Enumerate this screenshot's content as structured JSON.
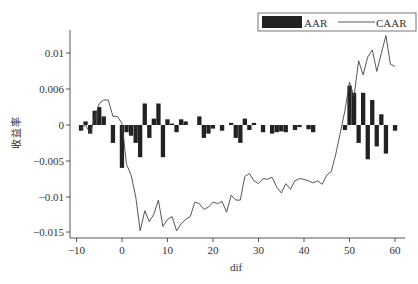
{
  "chart_data": {
    "type": "bar",
    "title": "",
    "xlabel": "dif",
    "ylabel": "收益率",
    "xlim": [
      -11,
      62
    ],
    "ylim": [
      -0.0155,
      0.0135
    ],
    "x_ticks": [
      -10,
      0,
      10,
      20,
      30,
      40,
      50,
      60
    ],
    "x_tick_labels": [
      "-10",
      "0",
      "10",
      "20",
      "30",
      "40",
      "50",
      "60"
    ],
    "y_ticks": [
      0.01,
      0.005,
      0,
      -0.005,
      -0.01,
      -0.015
    ],
    "y_tick_labels": [
      "0.01",
      "0.006",
      "0",
      "-0.005",
      "-0.01",
      "-0.015"
    ],
    "grid": false,
    "legend_position": "top-right",
    "legend": [
      "AAR",
      "CAAR"
    ],
    "x": [
      -9,
      -8,
      -7,
      -6,
      -5,
      -4,
      -3,
      -2,
      -1,
      0,
      1,
      2,
      3,
      4,
      5,
      6,
      7,
      8,
      9,
      10,
      11,
      12,
      13,
      14,
      15,
      16,
      17,
      18,
      19,
      20,
      21,
      22,
      23,
      24,
      25,
      26,
      27,
      28,
      29,
      30,
      31,
      32,
      33,
      34,
      35,
      36,
      37,
      38,
      39,
      40,
      41,
      42,
      43,
      44,
      45,
      46,
      47,
      48,
      49,
      50,
      51,
      52,
      53,
      54,
      55,
      56,
      57,
      58,
      59,
      60
    ],
    "series": [
      {
        "name": "AAR",
        "type": "bar",
        "color": "#222222",
        "values": [
          -0.0008,
          0.0005,
          -0.0012,
          0.002,
          0.0025,
          0.0012,
          0.0,
          -0.0025,
          0.0,
          -0.006,
          -0.001,
          -0.0015,
          -0.0025,
          -0.0045,
          0.003,
          -0.0018,
          0.0009,
          0.003,
          -0.0045,
          0.0008,
          0.0002,
          -0.001,
          0.0008,
          0.0005,
          0.0,
          0.0,
          0.0012,
          -0.0018,
          -0.0012,
          -0.0005,
          0.0,
          -0.0008,
          0.0,
          0.0003,
          -0.0018,
          -0.0025,
          0.0009,
          -0.0007,
          0.0003,
          0.0,
          -0.001,
          0.0,
          -0.0012,
          -0.001,
          -0.0009,
          -0.001,
          0.0,
          -0.0007,
          -0.0003,
          0.0,
          -0.0006,
          -0.001,
          0.0,
          0.0,
          0.0,
          0.0,
          0.0,
          0.0,
          -0.0007,
          0.0055,
          0.0045,
          -0.0025,
          0.0045,
          -0.0048,
          0.0035,
          -0.003,
          0.0015,
          -0.004,
          0.0,
          -0.0008
        ]
      },
      {
        "name": "CAAR",
        "type": "line",
        "color": "#444444",
        "values": [
          -0.0005,
          0.0,
          -0.0012,
          0.001,
          0.003,
          0.0035,
          0.0035,
          0.0012,
          0.0012,
          0.0002,
          -0.0055,
          -0.007,
          -0.01,
          -0.0148,
          -0.012,
          -0.0135,
          -0.0125,
          -0.0105,
          -0.0142,
          -0.0132,
          -0.0128,
          -0.0148,
          -0.0138,
          -0.0132,
          -0.0128,
          -0.0108,
          -0.011,
          -0.0118,
          -0.0115,
          -0.0108,
          -0.011,
          -0.0107,
          -0.0122,
          -0.0098,
          -0.0105,
          -0.0105,
          -0.0072,
          -0.0068,
          -0.0078,
          -0.0082,
          -0.0075,
          -0.0076,
          -0.0073,
          -0.0087,
          -0.0095,
          -0.0082,
          -0.009,
          -0.0078,
          -0.0075,
          -0.0076,
          -0.0078,
          -0.0081,
          -0.0078,
          -0.0083,
          -0.007,
          -0.0065,
          -0.004,
          -0.001,
          0.002,
          0.006,
          0.004,
          0.009,
          0.007,
          0.0095,
          0.0105,
          0.0075,
          0.01,
          0.0125,
          0.0085,
          0.0082
        ]
      }
    ]
  },
  "legend": {
    "aar_label": "AAR",
    "caar_label": "CAAR"
  },
  "axes": {
    "xlabel": "dif",
    "ylabel": "收益率"
  }
}
